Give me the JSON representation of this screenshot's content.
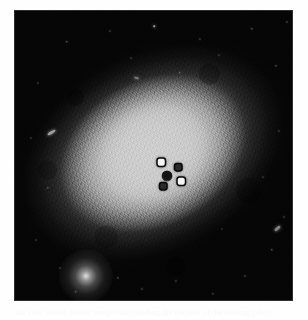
{
  "page": {
    "background_color": "#fefefe",
    "width": 308,
    "height": 320
  },
  "figure": {
    "name": "astronomical-plate",
    "kind": "grayscale astronomical image",
    "background_color": "#050505",
    "plate": {
      "x": 14,
      "y": 10,
      "width": 279,
      "height": 291
    },
    "galaxy": {
      "name": "lensing-galaxy",
      "core_color": "#cecece",
      "halo_color": "#b0b0b0",
      "tilt_degrees": -28,
      "center_x": 139,
      "center_y": 143
    },
    "foreground_star": {
      "x": 72,
      "y": 266,
      "brightness": "bright"
    },
    "nucleus": {
      "x": 153,
      "y": 166
    },
    "lensed_images": [
      {
        "label": "A",
        "x": 147,
        "y": 152,
        "brightness": "bright"
      },
      {
        "label": "B",
        "x": 164,
        "y": 157,
        "brightness": "dim"
      },
      {
        "label": "C",
        "x": 167,
        "y": 171,
        "brightness": "bright"
      },
      {
        "label": "D",
        "x": 149,
        "y": 176,
        "brightness": "dim"
      }
    ],
    "field_stars": [
      {
        "x": 53,
        "y": 32,
        "size": 1.4,
        "b": 0.55
      },
      {
        "x": 96,
        "y": 21,
        "size": 1.2,
        "b": 0.45
      },
      {
        "x": 117,
        "y": 48,
        "size": 1.1,
        "b": 0.4
      },
      {
        "x": 140,
        "y": 16,
        "size": 1.6,
        "b": 0.6
      },
      {
        "x": 166,
        "y": 63,
        "size": 1.3,
        "b": 0.5
      },
      {
        "x": 186,
        "y": 29,
        "size": 1.2,
        "b": 0.45
      },
      {
        "x": 205,
        "y": 45,
        "size": 1.1,
        "b": 0.42
      },
      {
        "x": 238,
        "y": 19,
        "size": 1.4,
        "b": 0.55
      },
      {
        "x": 262,
        "y": 56,
        "size": 1.3,
        "b": 0.5
      },
      {
        "x": 273,
        "y": 12,
        "size": 1.2,
        "b": 0.48
      },
      {
        "x": 24,
        "y": 73,
        "size": 1.1,
        "b": 0.4
      },
      {
        "x": 17,
        "y": 128,
        "size": 1.2,
        "b": 0.42
      },
      {
        "x": 34,
        "y": 178,
        "size": 1.3,
        "b": 0.48
      },
      {
        "x": 22,
        "y": 230,
        "size": 1.1,
        "b": 0.4
      },
      {
        "x": 46,
        "y": 258,
        "size": 1.2,
        "b": 0.44
      },
      {
        "x": 62,
        "y": 282,
        "size": 1.4,
        "b": 0.52
      },
      {
        "x": 104,
        "y": 268,
        "size": 1.3,
        "b": 0.5
      },
      {
        "x": 128,
        "y": 279,
        "size": 1.2,
        "b": 0.46
      },
      {
        "x": 162,
        "y": 271,
        "size": 1.2,
        "b": 0.44
      },
      {
        "x": 199,
        "y": 284,
        "size": 1.3,
        "b": 0.48
      },
      {
        "x": 231,
        "y": 266,
        "size": 1.2,
        "b": 0.46
      },
      {
        "x": 258,
        "y": 240,
        "size": 1.4,
        "b": 0.55
      },
      {
        "x": 270,
        "y": 207,
        "size": 1.2,
        "b": 0.44
      },
      {
        "x": 249,
        "y": 167,
        "size": 1.1,
        "b": 0.4
      },
      {
        "x": 265,
        "y": 121,
        "size": 1.2,
        "b": 0.42
      },
      {
        "x": 111,
        "y": 93,
        "size": 1.0,
        "b": 0.35
      },
      {
        "x": 208,
        "y": 219,
        "size": 1.0,
        "b": 0.35
      }
    ],
    "streaks": [
      {
        "x": 37,
        "y": 122,
        "w": 9,
        "h": 3,
        "rot": -32,
        "b": 0.62
      },
      {
        "x": 263,
        "y": 218,
        "w": 7,
        "h": 3,
        "rot": -40,
        "b": 0.52
      },
      {
        "x": 122,
        "y": 68,
        "w": 5,
        "h": 2,
        "rot": 18,
        "b": 0.4
      }
    ]
  },
  "caption": {
    "text": "the four lensed quasar images surrounding the nucleus of the lensing galaxy"
  }
}
